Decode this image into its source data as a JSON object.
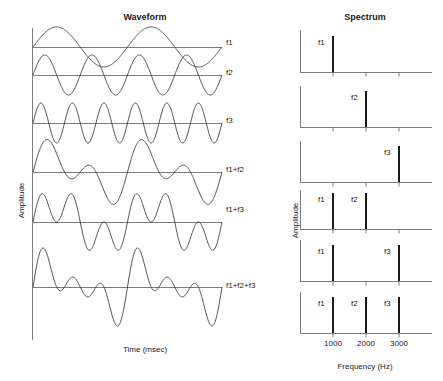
{
  "panels": {
    "waveform": {
      "title": "Waveform",
      "xlabel": "Time (msec)",
      "ylabel": "Amplitude"
    },
    "spectrum": {
      "title": "Spectrum",
      "xlabel": "Frequency (Hz)",
      "ylabel": "Amplitude"
    }
  },
  "traces": [
    {
      "label": "f1"
    },
    {
      "label": "f2"
    },
    {
      "label": "f3"
    },
    {
      "label": "f1+f2"
    },
    {
      "label": "f1+f3"
    },
    {
      "label": "f1+f2+f3"
    }
  ],
  "spectra": [
    {
      "peaks": [
        {
          "label": "f1"
        }
      ]
    },
    {
      "peaks": [
        {
          "label": "f2"
        }
      ]
    },
    {
      "peaks": [
        {
          "label": "f3"
        }
      ]
    },
    {
      "peaks": [
        {
          "label": "f1"
        },
        {
          "label": "f2"
        }
      ]
    },
    {
      "peaks": [
        {
          "label": "f1"
        },
        {
          "label": "f3"
        }
      ]
    },
    {
      "peaks": [
        {
          "label": "f1"
        },
        {
          "label": "f2"
        },
        {
          "label": "f3"
        }
      ]
    }
  ],
  "ticks": {
    "t1": "1000",
    "t2": "2000",
    "t3": "3000"
  },
  "chart_data": {
    "type": "line",
    "subplots": [
      {
        "panel": "Waveform",
        "xlabel": "Time (msec)",
        "ylabel": "Amplitude",
        "grid": false,
        "axis_ticks": [],
        "series": [
          {
            "name": "f1",
            "description": "sinusoid, 2 cycles across window, amplitude 1",
            "cycles": 2,
            "amplitude": 1
          },
          {
            "name": "f2",
            "description": "sinusoid, 4 cycles across window, amplitude 1",
            "cycles": 4,
            "amplitude": 1
          },
          {
            "name": "f3",
            "description": "sinusoid, 6 cycles across window, amplitude 1",
            "cycles": 6,
            "amplitude": 1
          },
          {
            "name": "f1+f2",
            "description": "sum of f1 and f2",
            "cycles": [
              2,
              4
            ],
            "amplitude": 2
          },
          {
            "name": "f1+f3",
            "description": "sum of f1 and f3",
            "cycles": [
              2,
              6
            ],
            "amplitude": 2
          },
          {
            "name": "f1+f2+f3",
            "description": "sum of f1, f2 and f3",
            "cycles": [
              2,
              4,
              6
            ],
            "amplitude": 3
          }
        ]
      },
      {
        "panel": "Spectrum",
        "type": "bar",
        "xlabel": "Frequency (Hz)",
        "ylabel": "Amplitude",
        "xlim": [
          0,
          4000
        ],
        "tick_values": [
          1000,
          2000,
          3000
        ],
        "tick_labels": [
          "1000",
          "2000",
          "3000"
        ],
        "grid": false,
        "series": [
          {
            "name": "f1",
            "frequencies": [
              1000
            ],
            "amplitudes": [
              1
            ],
            "labels": [
              "f1"
            ]
          },
          {
            "name": "f2",
            "frequencies": [
              2000
            ],
            "amplitudes": [
              1
            ],
            "labels": [
              "f2"
            ]
          },
          {
            "name": "f3",
            "frequencies": [
              3000
            ],
            "amplitudes": [
              1
            ],
            "labels": [
              "f3"
            ]
          },
          {
            "name": "f1+f2",
            "frequencies": [
              1000,
              2000
            ],
            "amplitudes": [
              1,
              1
            ],
            "labels": [
              "f1",
              "f2"
            ]
          },
          {
            "name": "f1+f3",
            "frequencies": [
              1000,
              3000
            ],
            "amplitudes": [
              1,
              1
            ],
            "labels": [
              "f1",
              "f3"
            ]
          },
          {
            "name": "f1+f2+f3",
            "frequencies": [
              1000,
              2000,
              3000
            ],
            "amplitudes": [
              1,
              1,
              1
            ],
            "labels": [
              "f1",
              "f2",
              "f3"
            ]
          }
        ]
      }
    ]
  }
}
